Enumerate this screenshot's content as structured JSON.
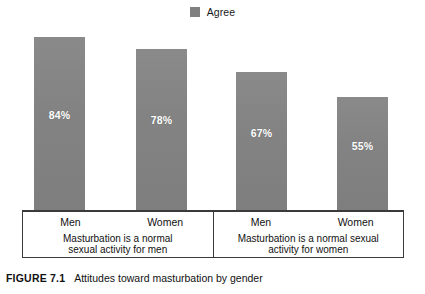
{
  "chart_data": {
    "type": "bar",
    "title": "",
    "xlabel": "",
    "ylabel": "",
    "ylim": [
      0,
      100
    ],
    "grid": false,
    "legend_position": "top-center",
    "legend": [
      {
        "label": "Agree",
        "color": "#808080"
      }
    ],
    "categories": [
      "Men",
      "Women",
      "Men",
      "Women"
    ],
    "values": [
      84,
      78,
      67,
      55
    ],
    "value_labels": [
      "84%",
      "78%",
      "67%",
      "55%"
    ],
    "series": [
      {
        "name": "Agree",
        "values": [
          84,
          78,
          67,
          55
        ]
      }
    ],
    "groups": [
      {
        "caption_line1": "Masturbation is a normal",
        "caption_line2": "sexual activity for men",
        "bars": [
          {
            "category": "Men",
            "value": 84,
            "label": "84%"
          },
          {
            "category": "Women",
            "value": 78,
            "label": "78%"
          }
        ]
      },
      {
        "caption_line1": "Masturbation is a normal sexual",
        "caption_line2": "activity for women",
        "bars": [
          {
            "category": "Men",
            "value": 67,
            "label": "67%"
          },
          {
            "category": "Women",
            "value": 55,
            "label": "55%"
          }
        ]
      }
    ]
  },
  "figure": {
    "label": "FIGURE 7.1",
    "title": "Attitudes toward masturbation by gender"
  },
  "colors": {
    "bar": "#878787",
    "legend_swatch": "#808080",
    "border": "#3a3a3a",
    "value_text": "#ffffff",
    "background": "#ffffff"
  }
}
